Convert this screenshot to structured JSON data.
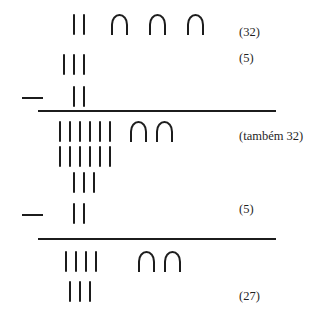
{
  "figure": {
    "glyphs": {
      "stroke": "|",
      "arch": "∩",
      "minus": "—"
    },
    "ink_color": "#1c1c1c",
    "background_color": "#ffffff",
    "blocks": [
      {
        "id": "block-1",
        "operator": "—",
        "rows": [
          {
            "id": "b1-r1",
            "strokes": 2,
            "arches": 3
          },
          {
            "id": "b1-r2",
            "strokes": 3,
            "arches": 0
          },
          {
            "id": "b1-r3",
            "strokes": 2,
            "arches": 0
          }
        ],
        "annotations": [
          {
            "id": "b1-a1",
            "text": "(32)"
          },
          {
            "id": "b1-a2",
            "text": "(5)"
          }
        ]
      },
      {
        "id": "block-2",
        "operator": "—",
        "rows": [
          {
            "id": "b2-r1",
            "strokes": 6,
            "arches": 2
          },
          {
            "id": "b2-r2",
            "strokes": 6,
            "arches": 0
          },
          {
            "id": "b2-r3",
            "strokes": 3,
            "arches": 0
          },
          {
            "id": "b2-r4",
            "strokes": 2,
            "arches": 0
          }
        ],
        "annotations": [
          {
            "id": "b2-a1",
            "text": "(também 32)"
          },
          {
            "id": "b2-a2",
            "text": "(5)"
          }
        ]
      },
      {
        "id": "block-3",
        "operator": null,
        "rows": [
          {
            "id": "b3-r1",
            "strokes": 4,
            "arches": 2
          },
          {
            "id": "b3-r2",
            "strokes": 3,
            "arches": 0
          }
        ],
        "annotations": [
          {
            "id": "b3-a1",
            "text": "(27)"
          }
        ]
      }
    ]
  }
}
